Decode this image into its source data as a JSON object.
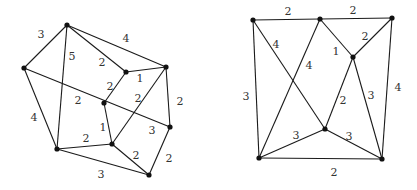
{
  "graphs": [
    {
      "id": "left",
      "vertices": {
        "A": [
          67,
          25
        ],
        "B": [
          24,
          68
        ],
        "C": [
          126,
          72
        ],
        "D": [
          166,
          67
        ],
        "E": [
          104,
          103
        ],
        "F": [
          170,
          127
        ],
        "G": [
          112,
          144
        ],
        "H": [
          57,
          149
        ],
        "I": [
          149,
          175
        ]
      },
      "edges": [
        {
          "from": "A",
          "to": "B",
          "weight": "3",
          "label_pos": [
            41,
            34
          ]
        },
        {
          "from": "A",
          "to": "D",
          "weight": "4",
          "label_pos": [
            126,
            38
          ]
        },
        {
          "from": "A",
          "to": "C",
          "weight": "2",
          "label_pos": [
            102,
            62
          ]
        },
        {
          "from": "A",
          "to": "H",
          "weight": "5",
          "label_pos": [
            72,
            56
          ]
        },
        {
          "from": "C",
          "to": "D",
          "weight": "1",
          "label_pos": [
            140,
            78
          ]
        },
        {
          "from": "C",
          "to": "E",
          "weight": "2",
          "label_pos": [
            110,
            86
          ]
        },
        {
          "from": "D",
          "to": "F",
          "weight": "2",
          "label_pos": [
            180,
            101
          ]
        },
        {
          "from": "D",
          "to": "G",
          "weight": "2",
          "label_pos": [
            138,
            98
          ]
        },
        {
          "from": "B",
          "to": "F",
          "weight": "2",
          "label_pos": [
            78,
            100
          ]
        },
        {
          "from": "B",
          "to": "H",
          "weight": "4",
          "label_pos": [
            34,
            117
          ]
        },
        {
          "from": "E",
          "to": "G",
          "weight": "1",
          "label_pos": [
            103,
            127
          ]
        },
        {
          "from": "F",
          "to": "I",
          "weight": "2",
          "label_pos": [
            169,
            158
          ]
        },
        {
          "from": "G",
          "to": "H",
          "weight": "2",
          "label_pos": [
            86,
            138
          ]
        },
        {
          "from": "G",
          "to": "I",
          "weight": "2",
          "label_pos": [
            136,
            155
          ]
        },
        {
          "from": "H",
          "to": "I",
          "weight": "3",
          "label_pos": [
            101,
            174
          ]
        }
      ],
      "extra_labels": [
        {
          "weight": "3",
          "label_pos": [
            152,
            130
          ]
        }
      ]
    },
    {
      "id": "right",
      "vertices": {
        "P": [
          253,
          20
        ],
        "Q": [
          320,
          19
        ],
        "R": [
          392,
          18
        ],
        "S": [
          353,
          57
        ],
        "T": [
          325,
          129
        ],
        "U": [
          259,
          158
        ],
        "V": [
          382,
          159
        ]
      },
      "edges": [
        {
          "from": "P",
          "to": "Q",
          "weight": "2",
          "label_pos": [
            288,
            11
          ]
        },
        {
          "from": "Q",
          "to": "R",
          "weight": "2",
          "label_pos": [
            353,
            10
          ]
        },
        {
          "from": "P",
          "to": "U",
          "weight": "3",
          "label_pos": [
            246,
            96
          ]
        },
        {
          "from": "P",
          "to": "T",
          "weight": "4",
          "label_pos": [
            276,
            44
          ]
        },
        {
          "from": "Q",
          "to": "U",
          "weight": "4",
          "label_pos": [
            309,
            65
          ]
        },
        {
          "from": "Q",
          "to": "S",
          "weight": "1",
          "label_pos": [
            336,
            51
          ]
        },
        {
          "from": "R",
          "to": "S",
          "weight": "2",
          "label_pos": [
            365,
            36
          ]
        },
        {
          "from": "R",
          "to": "V",
          "weight": "4",
          "label_pos": [
            398,
            87
          ]
        },
        {
          "from": "S",
          "to": "T",
          "weight": "2",
          "label_pos": [
            343,
            100
          ]
        },
        {
          "from": "S",
          "to": "V",
          "weight": "3",
          "label_pos": [
            371,
            95
          ]
        },
        {
          "from": "T",
          "to": "U",
          "weight": "3",
          "label_pos": [
            296,
            135
          ]
        },
        {
          "from": "T",
          "to": "V",
          "weight": "3",
          "label_pos": [
            349,
            136
          ]
        },
        {
          "from": "U",
          "to": "V",
          "weight": "2",
          "label_pos": [
            334,
            172
          ]
        }
      ],
      "extra_labels": []
    }
  ]
}
